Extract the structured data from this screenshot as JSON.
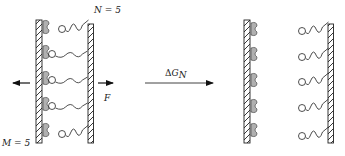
{
  "diagram": {
    "left_state": {
      "label_n": "N = 5",
      "label_m": "M = 5",
      "force_label": "F",
      "bonds": 5,
      "bonded_rows": [
        false,
        true,
        true,
        true,
        false
      ]
    },
    "transition": {
      "label_delta": "Δ",
      "label_g": "G",
      "label_sub": "N"
    },
    "right_state": {
      "bonds": 5,
      "bonded_rows": [
        false,
        false,
        false,
        false,
        false
      ]
    },
    "colors": {
      "stroke": "#222222",
      "receptor_fill": "#b0b0b0",
      "background": "#ffffff"
    }
  }
}
